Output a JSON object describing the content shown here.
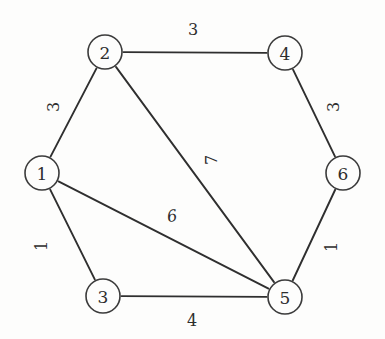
{
  "figure": {
    "background_color": "#fdfdfc",
    "ink_color": "#2f2f2f"
  },
  "chart_data": {
    "type": "diagram",
    "subtype": "weighted-undirected-graph",
    "title": "",
    "xlabel": "",
    "ylabel": "",
    "grid": false,
    "legend": false,
    "nodes": [
      {
        "id": "1",
        "label": "1",
        "x": 42,
        "y": 173,
        "r": 17
      },
      {
        "id": "2",
        "label": "2",
        "x": 105,
        "y": 52,
        "r": 17
      },
      {
        "id": "3",
        "label": "3",
        "x": 103,
        "y": 296,
        "r": 17
      },
      {
        "id": "4",
        "label": "4",
        "x": 285,
        "y": 53,
        "r": 17
      },
      {
        "id": "5",
        "label": "5",
        "x": 285,
        "y": 297,
        "r": 17
      },
      {
        "id": "6",
        "label": "6",
        "x": 343,
        "y": 173,
        "r": 17
      }
    ],
    "edges": [
      {
        "source": "2",
        "target": "4",
        "weight": 3,
        "label": "3",
        "label_x": 193,
        "label_y": 29,
        "label_rotation": 0
      },
      {
        "source": "1",
        "target": "2",
        "weight": 3,
        "label": "3",
        "label_x": 53,
        "label_y": 107,
        "label_rotation": -90
      },
      {
        "source": "4",
        "target": "6",
        "weight": 3,
        "label": "3",
        "label_x": 333,
        "label_y": 107,
        "label_rotation": -90
      },
      {
        "source": "2",
        "target": "5",
        "weight": 7,
        "label": "7",
        "label_x": 211,
        "label_y": 160,
        "label_rotation": -90
      },
      {
        "source": "1",
        "target": "3",
        "weight": 1,
        "label": "1",
        "label_x": 41,
        "label_y": 246,
        "label_rotation": -90
      },
      {
        "source": "1",
        "target": "5",
        "weight": 6,
        "label": "6",
        "label_x": 172,
        "label_y": 216,
        "label_rotation": -10
      },
      {
        "source": "5",
        "target": "6",
        "weight": 1,
        "label": "1",
        "label_x": 331,
        "label_y": 247,
        "label_rotation": -90
      },
      {
        "source": "3",
        "target": "5",
        "weight": 4,
        "label": "4",
        "label_x": 192,
        "label_y": 320,
        "label_rotation": 0
      }
    ],
    "weights": [
      3,
      3,
      3,
      7,
      1,
      6,
      1,
      4
    ],
    "node_count": 6,
    "edge_count": 8
  }
}
